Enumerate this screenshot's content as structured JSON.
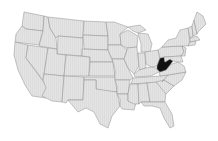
{
  "map": {
    "title": "United States",
    "highlighted_state": "West Virginia",
    "colors": {
      "background": "#ffffff",
      "state_fill": "#e3e3e3",
      "state_border": "#8f8f8f",
      "highlight_fill": "#111111",
      "lakes": "#ffffff"
    }
  }
}
